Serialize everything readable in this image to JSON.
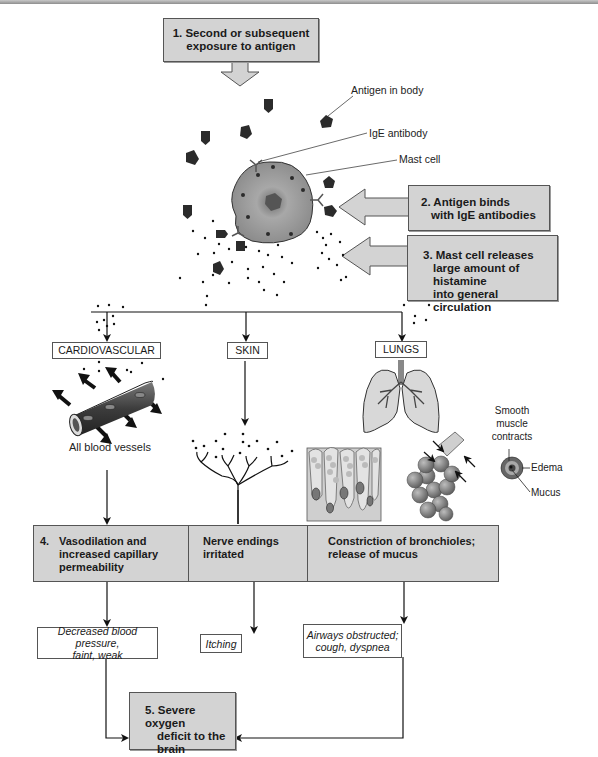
{
  "steps": {
    "step1": [
      "1. Second or subsequent",
      "exposure to antigen"
    ],
    "step2": [
      "2. Antigen binds",
      "with IgE antibodies"
    ],
    "step3": [
      "3. Mast cell releases",
      "large amount of histamine",
      "into general circulation"
    ],
    "step4_number": "4.",
    "step4_cardio": [
      "Vasodilation and",
      "increased capillary",
      "permeability"
    ],
    "step4_skin": [
      "Nerve endings",
      "irritated"
    ],
    "step4_lungs": [
      "Constriction of bronchioles;",
      "release of mucus"
    ],
    "step5": [
      "5. Severe oxygen",
      "deficit to the",
      "brain"
    ]
  },
  "labels": {
    "antigen_in_body": "Antigen in body",
    "ige_antibody": "IgE antibody",
    "mast_cell": "Mast cell",
    "all_blood_vessels": "All blood vessels",
    "smooth_muscle": [
      "Smooth",
      "muscle",
      "contracts"
    ],
    "edema": "Edema",
    "mucus": "Mucus"
  },
  "organs": {
    "cardiovascular": "CARDIOVASCULAR",
    "skin": "SKIN",
    "lungs": "LUNGS"
  },
  "outcomes": {
    "cardio": [
      "Decreased blood pressure,",
      "faint, weak"
    ],
    "skin": "Itching",
    "lungs": [
      "Airways obstructed;",
      "cough, dyspnea"
    ]
  },
  "colors": {
    "box_fill": "#d3d3d3",
    "border": "#555555",
    "antigen": "#2b2b2b",
    "mast_cell": "#9a9a9a"
  }
}
